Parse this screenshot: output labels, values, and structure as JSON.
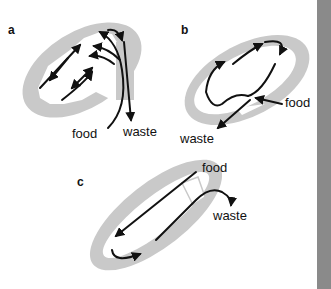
{
  "figure": {
    "type": "Comparison of gut types: digestive flow diagrams",
    "colors": {
      "body_wall": "#c9c9c9",
      "cavity": "#ffffff",
      "arrows": "#111111",
      "side_bar": "#8a8a8a"
    },
    "panels": [
      {
        "id": "a",
        "label": "a",
        "description": "Branched sac-like gut with single opening; food enters and waste exits through same opening",
        "labels": {
          "food": "food",
          "waste": "waste"
        }
      },
      {
        "id": "b",
        "label": "b",
        "description": "Sac-like gut with single opening; circular flow",
        "labels": {
          "food": "food",
          "waste": "waste"
        }
      },
      {
        "id": "c",
        "label": "c",
        "description": "Tube-like flow within elongated body; food enters and waste exits at top",
        "labels": {
          "food": "food",
          "waste": "waste"
        }
      }
    ]
  }
}
